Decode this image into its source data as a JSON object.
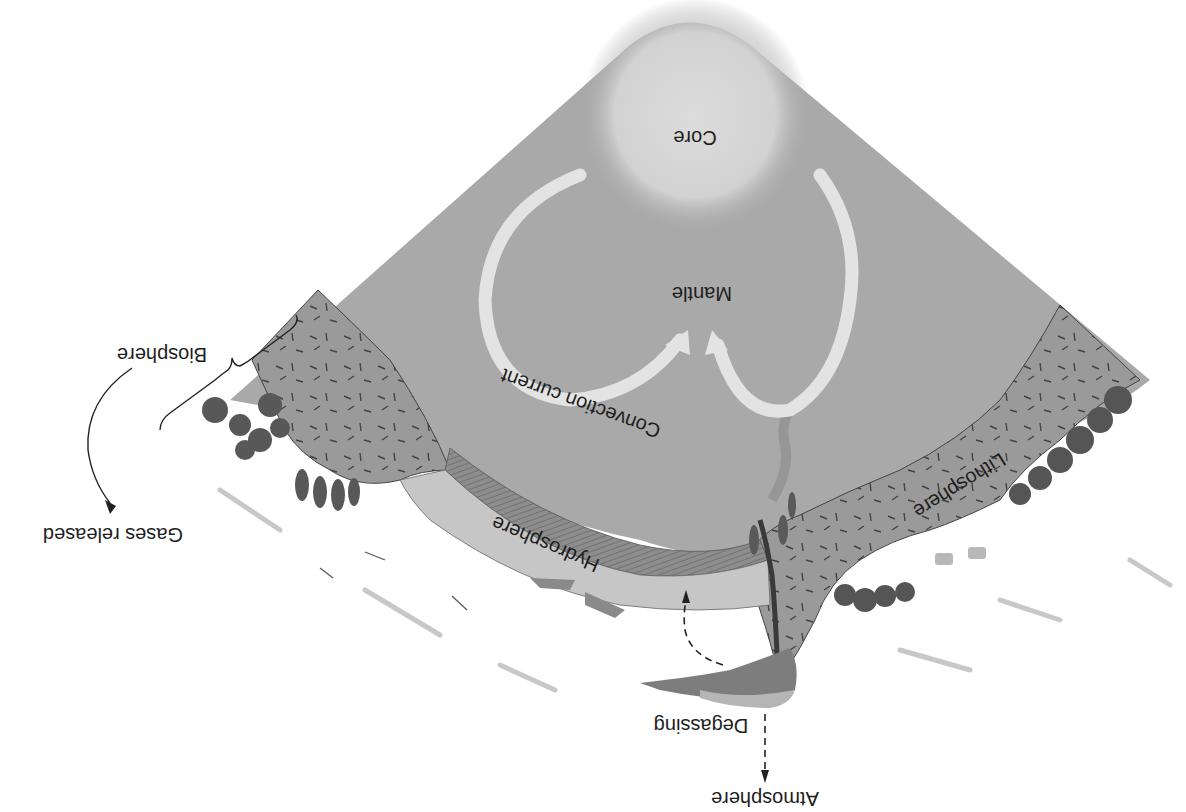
{
  "diagram": {
    "orientation": "rotated 180°",
    "labels": {
      "core": "Core",
      "mantle": "Mantle",
      "convection": "Convection current",
      "lithosphere": "Lithosphere",
      "hydrosphere": "Hydrosphere",
      "biosphere": "Biosphere",
      "gases_released": "Gases released",
      "degassing": "Degassing",
      "atmosphere": "Atmosphere"
    },
    "colors": {
      "mantle": "#a9a9a9",
      "core": "#d6d6d6",
      "lithosphere": "#9c9c9c",
      "ocean": "#c4c4c4",
      "oceanic_crust": "#8a8a8a",
      "arrow": "#e4e4e4",
      "vegetation": "#555555",
      "text": "#1e1e1e"
    }
  }
}
